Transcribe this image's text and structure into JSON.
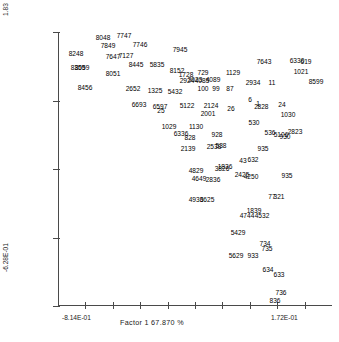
{
  "chart_data": {
    "type": "scatter",
    "title": "",
    "xlabel": "Factor 1  67.870 %",
    "ylabel": "",
    "grid": false,
    "legend": null,
    "xlim": [
      -0.814,
      0.172
    ],
    "ylim": [
      -0.628,
      1.83
    ],
    "xtick_labels": [
      "-8.14E-01",
      "1.72E-01"
    ],
    "ytick_labels": [
      "1.83",
      "-6.28E-01"
    ],
    "x_axis_tick_count": 9,
    "y_axis_tick_count": 5,
    "point_label_note": "each data point is drawn as its numeric sample ID",
    "points": [
      {
        "label": "8048",
        "x": 103,
        "y": 37
      },
      {
        "label": "7747",
        "x": 124,
        "y": 35
      },
      {
        "label": "7849",
        "x": 108,
        "y": 45
      },
      {
        "label": "7746",
        "x": 140,
        "y": 44
      },
      {
        "label": "8248",
        "x": 76,
        "y": 53
      },
      {
        "label": "7647",
        "x": 113,
        "y": 56
      },
      {
        "label": "7127",
        "x": 126,
        "y": 55
      },
      {
        "label": "7945",
        "x": 180,
        "y": 49
      },
      {
        "label": "8359",
        "x": 78,
        "y": 67
      },
      {
        "label": "8059",
        "x": 82,
        "y": 67
      },
      {
        "label": "8051",
        "x": 113,
        "y": 73
      },
      {
        "label": "8445",
        "x": 136,
        "y": 64
      },
      {
        "label": "5835",
        "x": 157,
        "y": 64
      },
      {
        "label": "8152",
        "x": 177,
        "y": 70
      },
      {
        "label": "1728",
        "x": 186,
        "y": 74
      },
      {
        "label": "729",
        "x": 203,
        "y": 72
      },
      {
        "label": "8456",
        "x": 85,
        "y": 87
      },
      {
        "label": "2652",
        "x": 133,
        "y": 88
      },
      {
        "label": "1325",
        "x": 155,
        "y": 90
      },
      {
        "label": "5432",
        "x": 175,
        "y": 91
      },
      {
        "label": "6693",
        "x": 139,
        "y": 104
      },
      {
        "label": "6597",
        "x": 160,
        "y": 106
      },
      {
        "label": "2924",
        "x": 187,
        "y": 80
      },
      {
        "label": "3023",
        "x": 195,
        "y": 79
      },
      {
        "label": "4085",
        "x": 202,
        "y": 80
      },
      {
        "label": "4089",
        "x": 213,
        "y": 79
      },
      {
        "label": "1129",
        "x": 233,
        "y": 72
      },
      {
        "label": "100",
        "x": 203,
        "y": 88
      },
      {
        "label": "99",
        "x": 216,
        "y": 88
      },
      {
        "label": "87",
        "x": 230,
        "y": 88
      },
      {
        "label": "2934",
        "x": 253,
        "y": 82
      },
      {
        "label": "11",
        "x": 272,
        "y": 82
      },
      {
        "label": "7643",
        "x": 264,
        "y": 61
      },
      {
        "label": "6330",
        "x": 297,
        "y": 60
      },
      {
        "label": "619",
        "x": 306,
        "y": 61
      },
      {
        "label": "1021",
        "x": 301,
        "y": 71
      },
      {
        "label": "8599",
        "x": 316,
        "y": 81
      },
      {
        "label": "25",
        "x": 161,
        "y": 110
      },
      {
        "label": "5122",
        "x": 187,
        "y": 105
      },
      {
        "label": "2124",
        "x": 211,
        "y": 105
      },
      {
        "label": "26",
        "x": 231,
        "y": 108
      },
      {
        "label": "6",
        "x": 250,
        "y": 99
      },
      {
        "label": "1",
        "x": 258,
        "y": 103
      },
      {
        "label": "2",
        "x": 256,
        "y": 106
      },
      {
        "label": "828",
        "x": 263,
        "y": 106
      },
      {
        "label": "24",
        "x": 282,
        "y": 104
      },
      {
        "label": "2001",
        "x": 208,
        "y": 113
      },
      {
        "label": "1030",
        "x": 288,
        "y": 114
      },
      {
        "label": "1029",
        "x": 169,
        "y": 126
      },
      {
        "label": "1130",
        "x": 196,
        "y": 126
      },
      {
        "label": "530",
        "x": 254,
        "y": 122
      },
      {
        "label": "6336",
        "x": 181,
        "y": 133
      },
      {
        "label": "828",
        "x": 190,
        "y": 137
      },
      {
        "label": "928",
        "x": 217,
        "y": 134
      },
      {
        "label": "536",
        "x": 270,
        "y": 132
      },
      {
        "label": "5106",
        "x": 281,
        "y": 134
      },
      {
        "label": "930",
        "x": 285,
        "y": 136
      },
      {
        "label": "2823",
        "x": 295,
        "y": 131
      },
      {
        "label": "2139",
        "x": 188,
        "y": 148
      },
      {
        "label": "2538",
        "x": 214,
        "y": 146
      },
      {
        "label": "538",
        "x": 221,
        "y": 145
      },
      {
        "label": "935",
        "x": 263,
        "y": 148
      },
      {
        "label": "43",
        "x": 243,
        "y": 160
      },
      {
        "label": "632",
        "x": 253,
        "y": 159
      },
      {
        "label": "4829",
        "x": 196,
        "y": 170
      },
      {
        "label": "3826",
        "x": 222,
        "y": 168
      },
      {
        "label": "1836",
        "x": 225,
        "y": 166
      },
      {
        "label": "935",
        "x": 287,
        "y": 175
      },
      {
        "label": "4649",
        "x": 199,
        "y": 178
      },
      {
        "label": "2836",
        "x": 213,
        "y": 179
      },
      {
        "label": "2425",
        "x": 242,
        "y": 174
      },
      {
        "label": "4250",
        "x": 251,
        "y": 176
      },
      {
        "label": "4936",
        "x": 196,
        "y": 199
      },
      {
        "label": "3625",
        "x": 207,
        "y": 199
      },
      {
        "label": "77",
        "x": 272,
        "y": 196
      },
      {
        "label": "321",
        "x": 279,
        "y": 196
      },
      {
        "label": "1839",
        "x": 254,
        "y": 210
      },
      {
        "label": "4744",
        "x": 247,
        "y": 215
      },
      {
        "label": "4532",
        "x": 262,
        "y": 215
      },
      {
        "label": "5429",
        "x": 238,
        "y": 232
      },
      {
        "label": "734",
        "x": 265,
        "y": 243
      },
      {
        "label": "735",
        "x": 267,
        "y": 248
      },
      {
        "label": "5629",
        "x": 236,
        "y": 255
      },
      {
        "label": "933",
        "x": 253,
        "y": 255
      },
      {
        "label": "634",
        "x": 268,
        "y": 269
      },
      {
        "label": "633",
        "x": 279,
        "y": 274
      },
      {
        "label": "736",
        "x": 281,
        "y": 292
      },
      {
        "label": "836",
        "x": 275,
        "y": 300
      }
    ]
  },
  "axes": {
    "y_top_label": "1.83",
    "y_bottom_label": "-6.28E-01",
    "x_left_label": "-8.14E-01",
    "x_right_label": "1.72E-01",
    "x_axis_title": "Factor 1  67.870 %"
  }
}
